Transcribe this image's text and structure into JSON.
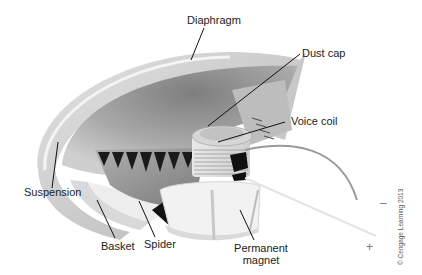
{
  "labels": {
    "diaphragm": "Diaphragm",
    "dust_cap": "Dust cap",
    "voice_coil": "Voice coil",
    "suspension": "Suspension",
    "basket": "Basket",
    "spider": "Spider",
    "permanent_magnet_line1": "Permanent",
    "permanent_magnet_line2": "magnet"
  },
  "terminals": {
    "negative": "–",
    "positive": "+"
  },
  "copyright": "© Cengage Learning 2013",
  "colors": {
    "background": "#ffffff",
    "label_text": "#222222",
    "leader_line": "#111111",
    "diaphragm_light": "#d8d8d8",
    "diaphragm_dark": "#8a8a8a",
    "basket": "#e6e6e6",
    "spider_teeth": "#1a1a1a",
    "magnet": "#f0f0f0",
    "wire": "#9a9a9a"
  }
}
